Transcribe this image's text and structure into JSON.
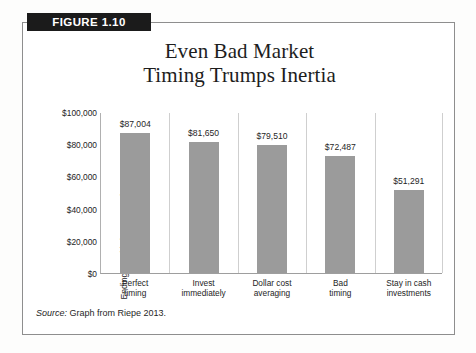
{
  "figure": {
    "banner_label": "FIGURE 1.10",
    "source_lead": "Source:",
    "source_text": " Graph from Riepe 2013."
  },
  "chart_data": {
    "type": "bar",
    "title": "Even Bad Market Timing Trumps Inertia",
    "title_line1": "Even Bad Market",
    "title_line2": "Timing Trumps Inertia",
    "xlabel": "",
    "ylabel": "Ending Wealth (1993–2012)",
    "ylim": [
      0,
      100000
    ],
    "ytick_labels": [
      "$100,000",
      "$80,000",
      "$60,000",
      "$40,000",
      "$20,000",
      "$0"
    ],
    "ytick_values": [
      100000,
      80000,
      60000,
      40000,
      20000,
      0
    ],
    "grid": false,
    "legend": "none",
    "bar_color": "#9b9b9b",
    "categories": [
      "Perfect timing",
      "Invest immediately",
      "Dollar cost averaging",
      "Bad timing",
      "Stay in cash investments"
    ],
    "category_lines": [
      [
        "Perfect",
        "timing"
      ],
      [
        "Invest",
        "immediately"
      ],
      [
        "Dollar cost",
        "averaging"
      ],
      [
        "Bad",
        "timing"
      ],
      [
        "Stay in cash",
        "investments"
      ]
    ],
    "values": [
      87004,
      81650,
      79510,
      72487,
      51291
    ],
    "value_labels": [
      "$87,004",
      "$81,650",
      "$79,510",
      "$72,487",
      "$51,291"
    ]
  }
}
